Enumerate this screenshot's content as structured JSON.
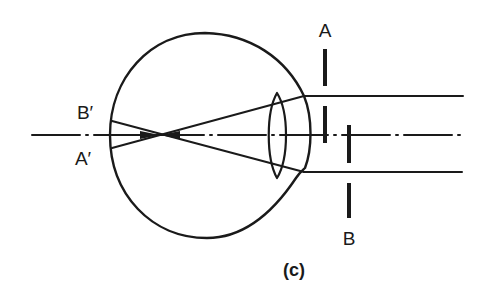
{
  "figure": {
    "caption": "(c)",
    "labels": {
      "aperture_a": "A",
      "aperture_b": "B",
      "image_b_prime": "B′",
      "image_a_prime": "A′"
    },
    "colors": {
      "ink": "#1a1a1a",
      "background": "#ffffff"
    }
  }
}
